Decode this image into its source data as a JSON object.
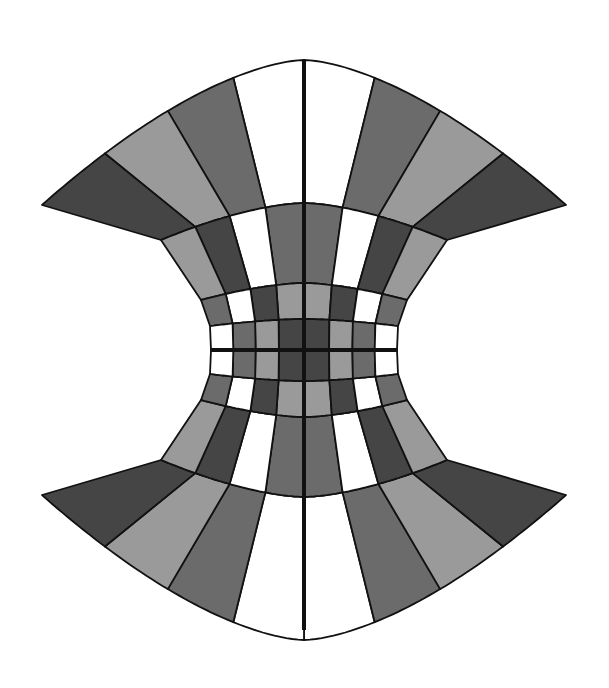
{
  "diagram": {
    "title": "",
    "width": 609,
    "height": 688,
    "palette": {
      "white": "#ffffff",
      "light": "#9a9a9a",
      "mid": "#6b6b6b",
      "dark": "#454545",
      "line": "#111111",
      "background": "#ffffff"
    },
    "center_x": 304,
    "axis_line_width": 4,
    "grid_line_width": 1.8,
    "row_boundaries_top": [
      {
        "center_y": 60,
        "edge_x": 262,
        "edge_y": 205,
        "bulge": 1.0
      },
      {
        "center_y": 203,
        "edge_x": 143,
        "edge_y": 240,
        "bulge": 0.75
      },
      {
        "center_y": 283,
        "edge_x": 103,
        "edge_y": 300,
        "bulge": 0.55
      },
      {
        "center_y": 319,
        "edge_x": 94,
        "edge_y": 326,
        "bulge": 0.4
      },
      {
        "center_y": 350,
        "edge_x": 93,
        "edge_y": 350,
        "bulge": 0.0
      }
    ],
    "column_fractions": [
      0,
      0.27,
      0.52,
      0.76,
      1.0
    ],
    "cell_colors_top_right_from_center": [
      [
        "white",
        "mid",
        "light",
        "dark"
      ],
      [
        "mid",
        "white",
        "dark",
        "light"
      ],
      [
        "light",
        "dark",
        "white",
        "mid"
      ],
      [
        "dark",
        "light",
        "mid",
        "white"
      ]
    ],
    "cell_colors_top_right_note": "rows listed outermost (top) to innermost (center); columns center to edge",
    "axes": {
      "vertical": true,
      "horizontal": true
    }
  }
}
